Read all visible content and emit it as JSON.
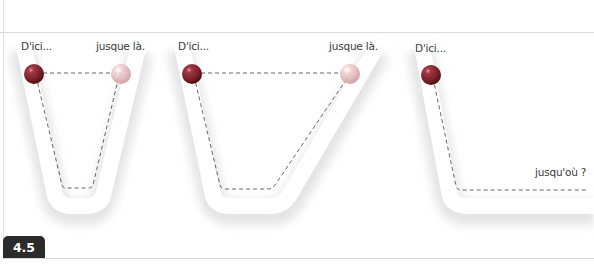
{
  "figure": {
    "number": "4.5",
    "panels": [
      {
        "id": "panel-1",
        "start_label": "D'ici...",
        "end_label": "jusque là.",
        "shape": "symmetric-trough"
      },
      {
        "id": "panel-2",
        "start_label": "D'ici...",
        "end_label": "jusque là.",
        "shape": "asymmetric-trough-gentle-right-slope"
      },
      {
        "id": "panel-3",
        "start_label": "D'ici...",
        "end_label": "jusqu'où ?",
        "shape": "slope-then-flat"
      }
    ],
    "colors": {
      "ball_start": "#8a2a33",
      "ball_end": "#e3b9b9",
      "dashed_line": "#555555",
      "track_shadow": "#e6e6e6",
      "badge_bg": "#2b2b2b",
      "badge_text": "#ffffff"
    }
  }
}
